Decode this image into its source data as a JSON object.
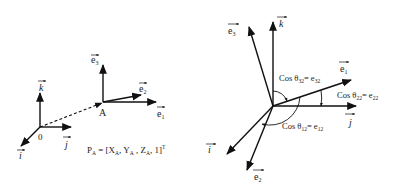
{
  "left_diagram": {
    "origin_label": "0",
    "point_label": "A",
    "world_axes": [
      {
        "name": "k",
        "label": "k"
      },
      {
        "name": "j",
        "label": "j"
      },
      {
        "name": "i",
        "label": "i"
      }
    ],
    "local_axes": [
      {
        "name": "e3",
        "label": "e",
        "sub": "3"
      },
      {
        "name": "e2",
        "label": "e",
        "sub": "2"
      },
      {
        "name": "e1",
        "label": "e",
        "sub": "1"
      }
    ],
    "position_formula": {
      "lhs": "P",
      "lhs_sub": "A",
      "eq": " = [X",
      "x_sub": "A",
      "y": ", Y",
      "y_sub": "A",
      "z": " , Z",
      "z_sub": "A",
      "tail": ", 1]",
      "sup": "T"
    }
  },
  "right_diagram": {
    "axes": [
      {
        "name": "k",
        "label": "k"
      },
      {
        "name": "j",
        "label": "j"
      },
      {
        "name": "i",
        "label": "i"
      },
      {
        "name": "e3",
        "label": "e",
        "sub": "3"
      },
      {
        "name": "e2",
        "label": "e",
        "sub": "2"
      },
      {
        "name": "e1",
        "label": "e",
        "sub": "1"
      }
    ],
    "angle_labels": [
      {
        "name": "cos32",
        "cos": "Cos θ",
        "theta_sub": "32",
        "eq": "= e",
        "e_sub": "32"
      },
      {
        "name": "cos22",
        "cos": "Cos θ",
        "theta_sub": "22",
        "eq": "= e",
        "e_sub": "22"
      },
      {
        "name": "cos12",
        "cos": "Cos θ",
        "theta_sub": "12",
        "eq": "= e",
        "e_sub": "12"
      }
    ]
  },
  "colors": {
    "stroke": "#111111",
    "background": "#ffffff"
  }
}
